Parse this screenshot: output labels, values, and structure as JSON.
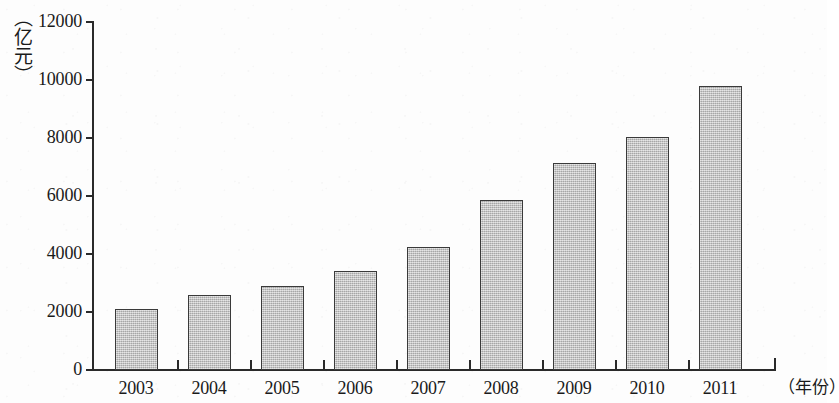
{
  "chart_data": {
    "type": "bar",
    "title": "",
    "subtitle": "",
    "xlabel": "（年份）",
    "ylabel": "（亿元）",
    "categories": [
      "2003",
      "2004",
      "2005",
      "2006",
      "2007",
      "2008",
      "2009",
      "2010",
      "2011"
    ],
    "values": [
      2100,
      2570,
      2880,
      3420,
      4230,
      5860,
      7120,
      8030,
      9780
    ],
    "series": [
      {
        "name": "",
        "values": [
          2100,
          2570,
          2880,
          3420,
          4230,
          5860,
          7120,
          8030,
          9780
        ]
      }
    ],
    "ylim": [
      0,
      12000
    ],
    "ytick_labels": [
      "0",
      "2000",
      "4000",
      "6000",
      "8000",
      "10000",
      "12000"
    ],
    "ytick_values": [
      0,
      2000,
      4000,
      6000,
      8000,
      10000,
      12000
    ],
    "grid": false,
    "legend": null,
    "legend_position": "none",
    "annotations": [],
    "bar_fill_color": "#bcbcbc",
    "bar_border_color": "#3a3a3a",
    "axis_color": "#2a2a2a",
    "background_color": "#fdfdfd"
  }
}
